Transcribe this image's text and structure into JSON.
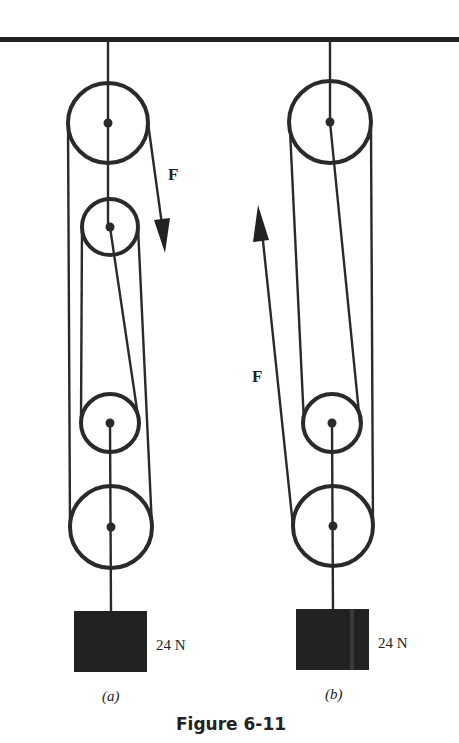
{
  "figure": {
    "caption": "Figure 6-11",
    "diagrams": [
      {
        "id": "a",
        "sublabel": "(a)",
        "force_label": "F",
        "force_direction": "down",
        "weight_label": "24 N",
        "pulleys": 4
      },
      {
        "id": "b",
        "sublabel": "(b)",
        "force_label": "F",
        "force_direction": "up",
        "weight_label": "24 N",
        "pulleys": 3
      }
    ]
  },
  "colors": {
    "ink": "#2a2a2a",
    "background": "#ffffff"
  }
}
